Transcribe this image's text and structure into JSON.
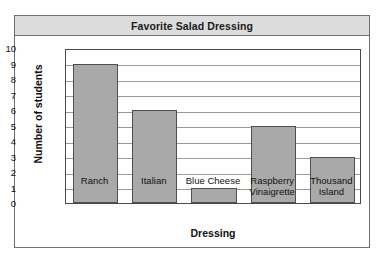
{
  "chart_data": {
    "type": "bar",
    "title": "Favorite Salad Dressing",
    "xlabel": "Dressing",
    "ylabel": "Number of students",
    "categories": [
      "Ranch",
      "Italian",
      "Blue Cheese",
      "Raspberry Vinaigrette",
      "Thousand Island"
    ],
    "category_lines": [
      [
        "Ranch"
      ],
      [
        "Italian"
      ],
      [
        "Blue Cheese"
      ],
      [
        "Raspberry",
        "Vinaigrette"
      ],
      [
        "Thousand",
        "Island"
      ]
    ],
    "values": [
      9,
      6,
      1,
      5,
      3
    ],
    "ylim": [
      0,
      10
    ],
    "ytick_labels": [
      "10",
      "9",
      "8",
      "7",
      "6",
      "5",
      "4",
      "3",
      "2",
      "1",
      "0"
    ],
    "ytick_values": [
      10,
      9,
      8,
      7,
      6,
      5,
      4,
      3,
      2,
      1,
      0
    ],
    "grid": true,
    "legend": "none",
    "colors": {
      "bar_fill": "#a9a9a9",
      "bar_border": "#4f4f4f",
      "title_bar": "#dcdcdc",
      "frame": "#6e6e6e",
      "gridline": "#9a9a9a",
      "text": "#111111",
      "background": "#ffffff"
    }
  }
}
